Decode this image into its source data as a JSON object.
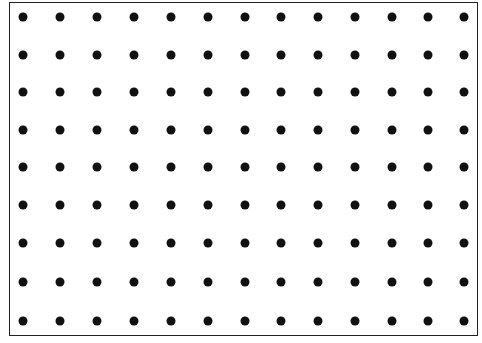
{
  "diagram": {
    "type": "dot-grid",
    "rows": 9,
    "columns": 13,
    "dot_color": "#111111",
    "border_color": "#222222",
    "x_positions": [
      23,
      60,
      97,
      134,
      171,
      208,
      245,
      281,
      318,
      355,
      392,
      428,
      464
    ],
    "y_positions": [
      17,
      55,
      92,
      130,
      167,
      205,
      243,
      282,
      321
    ]
  }
}
